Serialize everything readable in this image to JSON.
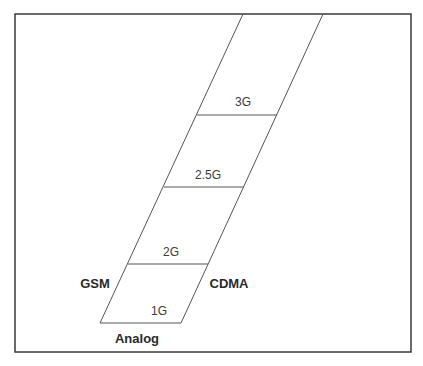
{
  "diagram": {
    "type": "stacked-parallelogram",
    "colors": {
      "line": "#555555",
      "frame": "#3a3a3a",
      "background": "#ffffff",
      "text": "#2b2b2b"
    },
    "generations": [
      {
        "id": "1g",
        "label": "1G"
      },
      {
        "id": "2g",
        "label": "2G"
      },
      {
        "id": "2-5g",
        "label": "2.5G"
      },
      {
        "id": "3g",
        "label": "3G"
      }
    ],
    "technologies": {
      "analog": "Analog",
      "gsm": "GSM",
      "cdma": "CDMA"
    }
  }
}
